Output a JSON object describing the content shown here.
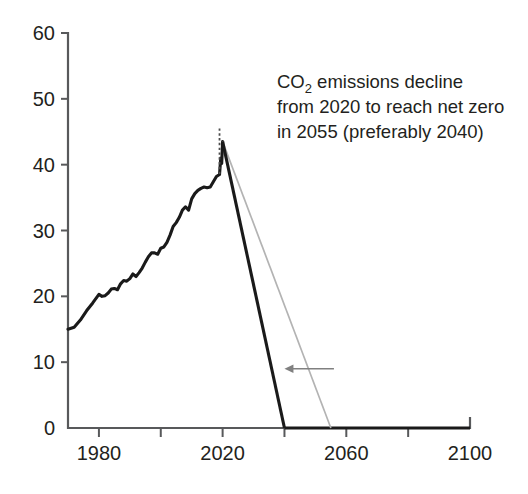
{
  "chart_data": {
    "type": "line",
    "title": "",
    "xlabel": "",
    "ylabel": "",
    "xlim": [
      1970,
      2100
    ],
    "ylim": [
      0,
      60
    ],
    "grid": false,
    "legend": "none",
    "x_ticks": [
      1980,
      2000,
      2020,
      2040,
      2060,
      2080,
      2100
    ],
    "x_tick_labels": [
      "1980",
      "",
      "2020",
      "",
      "2060",
      "",
      "2100"
    ],
    "y_ticks": [
      0,
      10,
      20,
      30,
      40,
      50,
      60
    ],
    "y_tick_labels": [
      "0",
      "10",
      "20",
      "30",
      "40",
      "50",
      "60"
    ],
    "annotations": [
      {
        "name": "net-zero-callout",
        "line1_prefix": "CO",
        "line1_sub": "2",
        "line1_rest": " emissions decline",
        "line2": "from 2020 to reach net zero",
        "line3": "in 2055 (preferably 2040)"
      }
    ],
    "markers": {
      "peak_year": 2019,
      "peak_value": 43.5,
      "dotted_line_year": 2020,
      "dotted_line_top": 45.5,
      "dotted_line_bottom": 38.5
    },
    "arrow": {
      "name": "decline-steepening-arrow",
      "from_year": 2056,
      "to_year": 2040,
      "value": 9.0,
      "direction": "left"
    },
    "series": [
      {
        "name": "Historical CO2 emissions",
        "color": "#1a1a1a",
        "style": "solid-thick",
        "points": [
          [
            1970,
            15.0
          ],
          [
            1972,
            15.3
          ],
          [
            1974,
            16.4
          ],
          [
            1976,
            17.8
          ],
          [
            1978,
            19.0
          ],
          [
            1980,
            20.3
          ],
          [
            1981,
            20.0
          ],
          [
            1982,
            20.1
          ],
          [
            1983,
            20.5
          ],
          [
            1984,
            21.1
          ],
          [
            1985,
            21.2
          ],
          [
            1986,
            21.0
          ],
          [
            1987,
            21.9
          ],
          [
            1988,
            22.4
          ],
          [
            1989,
            22.3
          ],
          [
            1990,
            22.7
          ],
          [
            1991,
            23.4
          ],
          [
            1992,
            23.0
          ],
          [
            1993,
            23.6
          ],
          [
            1994,
            24.3
          ],
          [
            1995,
            25.2
          ],
          [
            1996,
            26.0
          ],
          [
            1997,
            26.6
          ],
          [
            1998,
            26.6
          ],
          [
            1999,
            26.4
          ],
          [
            2000,
            27.3
          ],
          [
            2001,
            27.5
          ],
          [
            2002,
            28.2
          ],
          [
            2003,
            29.3
          ],
          [
            2004,
            30.6
          ],
          [
            2005,
            31.2
          ],
          [
            2006,
            32.0
          ],
          [
            2007,
            33.1
          ],
          [
            2008,
            33.6
          ],
          [
            2009,
            33.1
          ],
          [
            2010,
            34.8
          ],
          [
            2011,
            35.6
          ],
          [
            2012,
            36.1
          ],
          [
            2013,
            36.4
          ],
          [
            2014,
            36.6
          ],
          [
            2015,
            36.5
          ],
          [
            2016,
            36.6
          ],
          [
            2017,
            37.4
          ],
          [
            2018,
            38.2
          ],
          [
            2019,
            38.5
          ],
          [
            2019.4,
            41.0
          ],
          [
            2019.7,
            40.2
          ],
          [
            2020,
            43.5
          ]
        ]
      },
      {
        "name": "Fast decline to net zero 2040",
        "color": "#1a1a1a",
        "style": "solid-thick",
        "points": [
          [
            2020,
            43.5
          ],
          [
            2040,
            0
          ]
        ]
      },
      {
        "name": "Slower decline to net zero 2055",
        "color": "#b3b3b3",
        "style": "solid-thin",
        "points": [
          [
            2020,
            43.5
          ],
          [
            2055,
            0
          ]
        ]
      },
      {
        "name": "Net zero baseline",
        "color": "#1a1a1a",
        "style": "solid-thick",
        "points": [
          [
            2040,
            0
          ],
          [
            2100,
            0
          ]
        ]
      }
    ]
  },
  "geometry": {
    "plot_left": 68,
    "plot_right": 470,
    "plot_bottom": 428,
    "plot_top": 33,
    "x_min": 1970,
    "x_max": 2100,
    "y_min": 0,
    "y_max": 60
  }
}
